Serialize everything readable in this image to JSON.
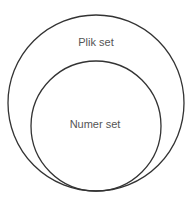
{
  "diagram": {
    "type": "nested-sets",
    "outer_set": {
      "label": "Plik set",
      "cx": 96,
      "cy": 103,
      "r": 88
    },
    "inner_set": {
      "label": "Numer set",
      "cx": 96,
      "cy": 126,
      "r": 65
    },
    "stroke_color": "#333333"
  }
}
